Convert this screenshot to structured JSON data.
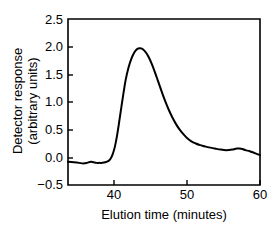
{
  "chart_data": {
    "type": "line",
    "title": "",
    "subtitle": "",
    "xlabel": "Elution time (minutes)",
    "ylabel_line1": "Detector response",
    "ylabel_line2": "(arbitrary units)",
    "ylabel": "Detector response (arbitrary units)",
    "xlim": [
      33.7,
      60
    ],
    "ylim": [
      -0.5,
      2.5
    ],
    "xticks": [
      40,
      50,
      60
    ],
    "xtick_labels": [
      "40",
      "50",
      "60"
    ],
    "yticks": [
      -0.5,
      0.0,
      0.5,
      1.0,
      1.5,
      2.0,
      2.5
    ],
    "ytick_labels": [
      "−0.5",
      "0.0",
      "0.5",
      "1.0",
      "1.5",
      "2.0",
      "2.5"
    ],
    "grid": false,
    "legend": null,
    "legend_position": "none",
    "series": [
      {
        "name": "chromatogram",
        "color": "#000000",
        "x": [
          33.7,
          34.5,
          35.2,
          35.8,
          36.3,
          36.8,
          37.2,
          37.6,
          38.0,
          38.4,
          38.8,
          39.2,
          39.5,
          39.8,
          40.1,
          40.4,
          40.7,
          41.0,
          41.3,
          41.6,
          42.0,
          42.4,
          42.8,
          43.2,
          43.6,
          44.0,
          44.4,
          44.8,
          45.2,
          45.6,
          46.0,
          46.5,
          47.0,
          47.5,
          48.0,
          48.5,
          49.0,
          49.5,
          50.0,
          50.6,
          51.2,
          51.8,
          52.4,
          53.0,
          53.8,
          54.6,
          55.4,
          56.2,
          56.8,
          57.2,
          57.6,
          58.0,
          58.6,
          59.2,
          60.0
        ],
        "y": [
          -0.08,
          -0.09,
          -0.1,
          -0.11,
          -0.1,
          -0.08,
          -0.09,
          -0.1,
          -0.1,
          -0.1,
          -0.09,
          -0.07,
          -0.03,
          0.05,
          0.18,
          0.38,
          0.63,
          0.9,
          1.16,
          1.4,
          1.63,
          1.79,
          1.9,
          1.96,
          1.97,
          1.95,
          1.89,
          1.8,
          1.68,
          1.54,
          1.39,
          1.2,
          1.02,
          0.86,
          0.72,
          0.6,
          0.5,
          0.42,
          0.35,
          0.29,
          0.25,
          0.22,
          0.2,
          0.18,
          0.16,
          0.14,
          0.13,
          0.14,
          0.16,
          0.16,
          0.15,
          0.13,
          0.11,
          0.08,
          0.04
        ]
      }
    ],
    "peak": {
      "x": 43.5,
      "y": 1.97
    },
    "baseline_level": -0.1
  }
}
